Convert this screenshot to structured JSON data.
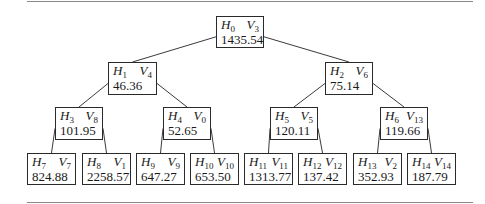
{
  "tree": {
    "nodes": [
      {
        "id": "n0",
        "h": "0",
        "v": "3",
        "value": "1435.54",
        "x": 216,
        "y": 16,
        "w": 48,
        "hgt": 32
      },
      {
        "id": "n1",
        "h": "1",
        "v": "4",
        "value": "46.36",
        "x": 108,
        "y": 62,
        "w": 49,
        "hgt": 33
      },
      {
        "id": "n2",
        "h": "2",
        "v": "6",
        "value": "75.14",
        "x": 325,
        "y": 62,
        "w": 48,
        "hgt": 33
      },
      {
        "id": "n3",
        "h": "3",
        "v": "8",
        "value": "101.95",
        "x": 55,
        "y": 107,
        "w": 48,
        "hgt": 33
      },
      {
        "id": "n4",
        "h": "4",
        "v": "0",
        "value": "52.65",
        "x": 163,
        "y": 107,
        "w": 48,
        "hgt": 33
      },
      {
        "id": "n5",
        "h": "5",
        "v": "5",
        "value": "120.11",
        "x": 270,
        "y": 107,
        "w": 48,
        "hgt": 33
      },
      {
        "id": "n6",
        "h": "6",
        "v": "13",
        "value": "119.66",
        "x": 380,
        "y": 107,
        "w": 48,
        "hgt": 33
      },
      {
        "id": "n7",
        "h": "7",
        "v": "7",
        "value": "824.88",
        "x": 27,
        "y": 153,
        "w": 49,
        "hgt": 32
      },
      {
        "id": "n8",
        "h": "8",
        "v": "1",
        "value": "2258.57",
        "x": 82,
        "y": 153,
        "w": 49,
        "hgt": 32
      },
      {
        "id": "n9",
        "h": "9",
        "v": "9",
        "value": "647.27",
        "x": 136,
        "y": 153,
        "w": 49,
        "hgt": 32
      },
      {
        "id": "n10",
        "h": "10",
        "v": "10",
        "value": "653.50",
        "x": 190,
        "y": 153,
        "w": 49,
        "hgt": 32
      },
      {
        "id": "n11",
        "h": "11",
        "v": "11",
        "value": "1313.77",
        "x": 244,
        "y": 153,
        "w": 49,
        "hgt": 32
      },
      {
        "id": "n12",
        "h": "12",
        "v": "12",
        "value": "137.42",
        "x": 298,
        "y": 153,
        "w": 49,
        "hgt": 32
      },
      {
        "id": "n13",
        "h": "13",
        "v": "2",
        "value": "352.93",
        "x": 353,
        "y": 153,
        "w": 49,
        "hgt": 32
      },
      {
        "id": "n14",
        "h": "14",
        "v": "14",
        "value": "187.79",
        "x": 407,
        "y": 153,
        "w": 49,
        "hgt": 32
      }
    ],
    "edges": [
      [
        "n0",
        "n1"
      ],
      [
        "n0",
        "n2"
      ],
      [
        "n1",
        "n3"
      ],
      [
        "n1",
        "n4"
      ],
      [
        "n2",
        "n5"
      ],
      [
        "n2",
        "n6"
      ],
      [
        "n3",
        "n7"
      ],
      [
        "n3",
        "n8"
      ],
      [
        "n4",
        "n9"
      ],
      [
        "n4",
        "n10"
      ],
      [
        "n5",
        "n11"
      ],
      [
        "n5",
        "n12"
      ],
      [
        "n6",
        "n13"
      ],
      [
        "n6",
        "n14"
      ]
    ],
    "label_prefix_h": "H",
    "label_prefix_v": "V"
  }
}
